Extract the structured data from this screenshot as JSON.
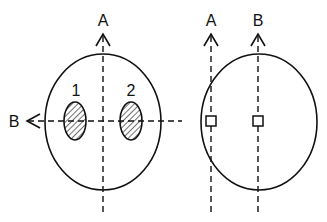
{
  "left_figure": {
    "axis_a_label": "A",
    "axis_b_label": "B",
    "region_1_label": "1",
    "region_2_label": "2"
  },
  "right_figure": {
    "axis_a_label": "A",
    "axis_b_label": "B"
  },
  "colors": {
    "stroke": "#111111",
    "background": "#ffffff"
  }
}
